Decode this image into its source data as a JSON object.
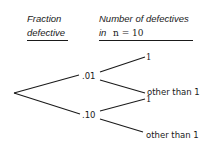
{
  "header": {
    "col1_line1": "Fraction",
    "col1_line2": "defective",
    "col2_line1": "Number of defectives",
    "col2_line2_prefix": "in",
    "col2_line2_expr": "n = 10"
  },
  "tree": {
    "branches": [
      {
        "label": ".01",
        "outcomes": [
          {
            "label": "1"
          },
          {
            "label": "other than 1"
          }
        ]
      },
      {
        "label": ".10",
        "outcomes": [
          {
            "label": "1"
          },
          {
            "label": "other than 1"
          }
        ]
      }
    ]
  },
  "colors": {
    "ink": "#1a1a1a",
    "background": "#ffffff"
  }
}
